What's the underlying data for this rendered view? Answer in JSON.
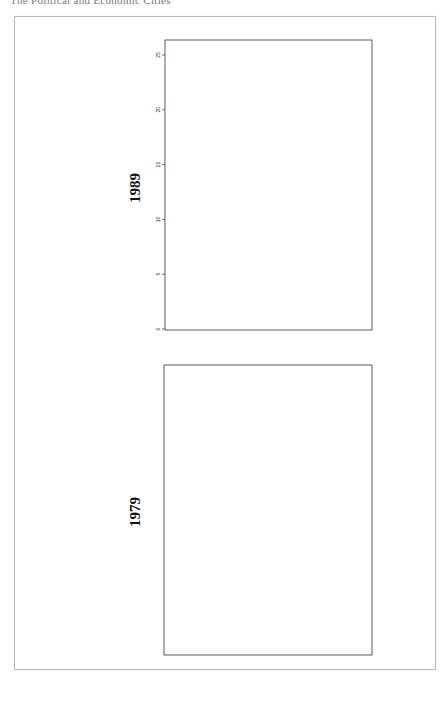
{
  "page": {
    "header_text": "The Political and Economic Cities",
    "frame_color": "#b9b9b9"
  },
  "chart_data": [
    {
      "type": "dendrogram",
      "title": "1989",
      "orientation": "vertical",
      "ylabel": "",
      "ylim": [
        0,
        25
      ],
      "yticks": [
        0,
        5,
        10,
        15,
        20,
        25
      ],
      "leaves": [
        "ESP 18",
        "USA 22",
        "POR 17",
        "SWZ 20",
        "IRE 11",
        "JAP 13",
        "BEL 3",
        "GER 8",
        "GRE 9",
        "AUL 1",
        "NZL 15",
        "CAN 4",
        "NET 14",
        "FRA 7",
        "ICE 10",
        "NOR 16",
        "AUS 2",
        "ITA 12",
        "UK 21",
        "FIN 6",
        "SWE 19",
        "DEN 5"
      ],
      "merges": [
        {
          "children": [
            "ESP 18",
            "USA 22"
          ],
          "height": 1
        },
        {
          "children": [
            "USA 22",
            "POR 17"
          ],
          "height": 1
        },
        {
          "children": [
            "ESP-USA-POR",
            "SWZ 20"
          ],
          "height": 2
        },
        {
          "children": [
            "A",
            "IRE 11"
          ],
          "height": 4
        },
        {
          "children": [
            "B",
            "JAP 13"
          ],
          "height": 6
        },
        {
          "children": [
            "BEL 3",
            "GER 8"
          ],
          "height": 1
        },
        {
          "children": [
            "BEL-GER",
            "GRE 9"
          ],
          "height": 2
        },
        {
          "children": [
            "C",
            "BEL-GER-GRE"
          ],
          "height": 6
        },
        {
          "children": [
            "AUL 1",
            "NZL 15"
          ],
          "height": 1
        },
        {
          "children": [
            "CAN 4",
            "NET 14"
          ],
          "height": 1
        },
        {
          "children": [
            "NET 14",
            "FRA 7"
          ],
          "height": 1
        },
        {
          "children": [
            "ICE 10",
            "NOR 16"
          ],
          "height": 3
        },
        {
          "children": [
            "CAN-NET-FRA",
            "ICE-NOR"
          ],
          "height": 5
        },
        {
          "children": [
            "AUL-NZL",
            "D"
          ],
          "height": 10
        },
        {
          "children": [
            "E",
            "F"
          ],
          "height": 12
        },
        {
          "children": [
            "AUS 2",
            "ITA 12"
          ],
          "height": 2
        },
        {
          "children": [
            "AUS-ITA",
            "UK 21"
          ],
          "height": 11
        },
        {
          "children": [
            "G",
            "H"
          ],
          "height": 16
        },
        {
          "children": [
            "FIN 6",
            "SWE 19"
          ],
          "height": 1
        },
        {
          "children": [
            "FIN-SWE",
            "DEN 5"
          ],
          "height": 6
        },
        {
          "children": [
            "I",
            "J"
          ],
          "height": 25
        }
      ]
    },
    {
      "type": "dendrogram",
      "title": "1979",
      "orientation": "vertical",
      "ylabel": "",
      "ylim": [
        0,
        25
      ],
      "yticks": [
        0,
        5,
        10,
        15,
        20,
        25
      ],
      "leaves": [
        "CAN 4",
        "NET 14",
        "JPN 13",
        "ESP 18",
        "USA 22",
        "FRA 7",
        "BEL 3",
        "POR 17",
        "SWZ 20",
        "IRE 11",
        "ICE 10",
        "NZL 15",
        "AUL 1",
        "DEN 5",
        "SWE 19",
        "NOR 16",
        "FIN 6",
        "AUS 2",
        "ITA 12",
        "GRE 9",
        "GER 8",
        "UK 21"
      ],
      "merges": [
        {
          "children": [
            "CAN 4",
            "NET 14"
          ],
          "height": 1
        },
        {
          "children": [
            "CAN-NET",
            "JPN 13"
          ],
          "height": 2
        },
        {
          "children": [
            "ESP 18",
            "USA 22"
          ],
          "height": 1
        },
        {
          "children": [
            "ESP-USA",
            "FRA 7"
          ],
          "height": 2
        },
        {
          "children": [
            "BEL 3",
            "POR 17"
          ],
          "height": 1
        },
        {
          "children": [
            "BEL-POR",
            "SWZ 20"
          ],
          "height": 2
        },
        {
          "children": [
            "ESP-USA-FRA",
            "BEL-POR-SWZ"
          ],
          "height": 4
        },
        {
          "children": [
            "A",
            "B"
          ],
          "height": 7
        },
        {
          "children": [
            "C",
            "IRE 11"
          ],
          "height": 14
        },
        {
          "children": [
            "ICE 10",
            "NZL 15"
          ],
          "height": 2
        },
        {
          "children": [
            "ICE-NZL",
            "AUL 1"
          ],
          "height": 4
        },
        {
          "children": [
            "DEN 5",
            "SWE 19"
          ],
          "height": 5
        },
        {
          "children": [
            "DEN-SWE",
            "NOR 16"
          ],
          "height": 6
        },
        {
          "children": [
            "D",
            "E"
          ],
          "height": 14
        },
        {
          "children": [
            "F",
            "FIN 6"
          ],
          "height": 16
        },
        {
          "children": [
            "G",
            "H"
          ],
          "height": 18
        },
        {
          "children": [
            "AUS 2",
            "ITA 12"
          ],
          "height": 3
        },
        {
          "children": [
            "AUS-ITA",
            "GRE 9"
          ],
          "height": 4
        },
        {
          "children": [
            "I",
            "GER 8"
          ],
          "height": 8
        },
        {
          "children": [
            "J",
            "UK 21"
          ],
          "height": 18
        },
        {
          "children": [
            "K",
            "L"
          ],
          "height": 25
        }
      ]
    }
  ],
  "panels": {
    "top": {
      "year": "1989"
    },
    "bottom": {
      "year": "1979"
    }
  }
}
